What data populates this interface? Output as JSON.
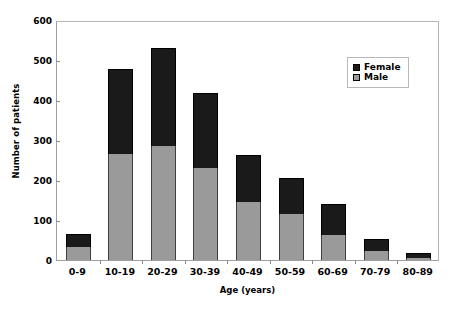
{
  "chart_data": {
    "type": "bar",
    "subtype": "stacked-vertical",
    "title": "",
    "xlabel": "Age (years)",
    "ylabel": "Number of patients",
    "categories": [
      "0-9",
      "10-19",
      "20-29",
      "30-39",
      "40-49",
      "50-59",
      "60-69",
      "70-79",
      "80-89"
    ],
    "series": [
      {
        "name": "Male",
        "color": "#9a9a9a",
        "values": [
          33,
          264,
          284,
          229,
          146,
          116,
          63,
          23,
          6
        ]
      },
      {
        "name": "Female",
        "color": "#1a1a1a",
        "values": [
          32,
          214,
          245,
          189,
          116,
          88,
          76,
          30,
          12
        ]
      }
    ],
    "totals": [
      65,
      478,
      529,
      418,
      262,
      204,
      139,
      53,
      18
    ],
    "ylim": [
      0,
      600
    ],
    "yticks": [
      0,
      100,
      200,
      300,
      400,
      500,
      600
    ],
    "ytick_labels": [
      "0",
      "100",
      "200",
      "300",
      "400",
      "500",
      "600"
    ],
    "grid": false,
    "legend": {
      "position": "top-right-inside",
      "entries": [
        {
          "label": "Female",
          "color": "#1a1a1a"
        },
        {
          "label": "Male",
          "color": "#9a9a9a"
        }
      ]
    }
  },
  "colors": {
    "female": "#1a1a1a",
    "male": "#9a9a9a",
    "axis": "#8a8a8a",
    "plot_border": "#a0a0a0",
    "background": "#ffffff",
    "text": "#000000"
  }
}
